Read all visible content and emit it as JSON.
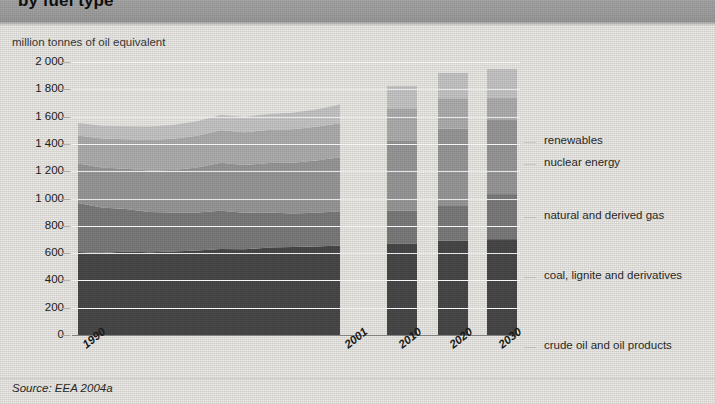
{
  "banner": {
    "title": "by fuel type"
  },
  "axis": {
    "unit_caption": "million tonnes of oil equivalent",
    "y_ticks": [
      "2 000",
      "1 800",
      "1 600",
      "1 400",
      "1 200",
      "1 000",
      "800",
      "600",
      "400",
      "200",
      "0"
    ],
    "x_ticks": [
      "1990",
      "2001",
      "2010",
      "2020",
      "2030"
    ]
  },
  "legend": {
    "items": [
      {
        "label": "renewables",
        "color": "#c8c8c8"
      },
      {
        "label": "nuclear energy",
        "color": "#b0b0b0"
      },
      {
        "label": "natural and derived gas",
        "color": "#9a9a9a"
      },
      {
        "label": "coal, lignite and derivatives",
        "color": "#7d7d7d"
      },
      {
        "label": "crude oil and oil products",
        "color": "#4a4a4a"
      }
    ]
  },
  "source": {
    "text": "Source: EEA 2004a"
  },
  "colors": {
    "crude_oil": "#4a4a4a",
    "coal": "#7d7d7d",
    "gas": "#9a9a9a",
    "nuclear": "#b0b0b0",
    "renewables": "#c8c8c8",
    "background": "#edebe7",
    "banner": "#a2a2a2",
    "gridline": "#ffffff",
    "axis": "#8e8e8e"
  },
  "chart_data": {
    "type": "area",
    "title": "by fuel type",
    "xlabel": "",
    "ylabel": "million tonnes of oil equivalent",
    "ylim": [
      0,
      2000
    ],
    "ytick_step": 200,
    "grid": true,
    "legend_position": "right",
    "annotations": [
      "Source: EEA 2004a"
    ],
    "note": "Stacked area for historical years 1990-2001; stacked columns for projection years 2010, 2020, 2030.",
    "series_order_bottom_to_top": [
      "crude oil and oil products",
      "coal, lignite and derivatives",
      "natural and derived gas",
      "nuclear energy",
      "renewables"
    ],
    "area_x": [
      1990,
      1991,
      1992,
      1993,
      1994,
      1995,
      1996,
      1997,
      1998,
      1999,
      2000,
      2001
    ],
    "series": [
      {
        "name": "crude oil and oil products",
        "values": [
          608,
          600,
          612,
          606,
          612,
          618,
          630,
          628,
          640,
          645,
          648,
          655
        ]
      },
      {
        "name": "coal, lignite and derivatives",
        "values": [
          360,
          335,
          310,
          295,
          285,
          280,
          280,
          268,
          258,
          245,
          248,
          252
        ]
      },
      {
        "name": "natural and derived gas",
        "values": [
          288,
          292,
          296,
          305,
          312,
          330,
          352,
          350,
          362,
          372,
          382,
          395
        ]
      },
      {
        "name": "nuclear energy",
        "values": [
          205,
          212,
          216,
          222,
          228,
          232,
          238,
          240,
          242,
          246,
          248,
          250
        ]
      },
      {
        "name": "renewables",
        "values": [
          92,
          94,
          96,
          100,
          102,
          106,
          112,
          112,
          116,
          120,
          126,
          136
        ]
      }
    ],
    "bar_x": [
      2010,
      2020,
      2030
    ],
    "bar_series": [
      {
        "name": "crude oil and oil products",
        "values": [
          668,
          692,
          702
        ]
      },
      {
        "name": "coal, lignite and derivatives",
        "values": [
          245,
          258,
          330
        ]
      },
      {
        "name": "natural and derived gas",
        "values": [
          508,
          562,
          545
        ]
      },
      {
        "name": "nuclear energy",
        "values": [
          240,
          222,
          160
        ]
      },
      {
        "name": "renewables",
        "values": [
          162,
          186,
          212
        ]
      }
    ],
    "bar_totals": [
      1823,
      1920,
      1949
    ]
  }
}
